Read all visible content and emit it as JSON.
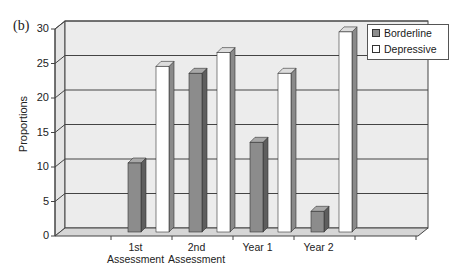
{
  "panel_label": "(b)",
  "chart_data": {
    "type": "bar",
    "title": "",
    "xlabel": "",
    "ylabel": "Proportions",
    "ylim": [
      0,
      30
    ],
    "yticks": [
      0,
      5,
      10,
      15,
      20,
      25,
      30
    ],
    "grid": true,
    "style": "3d-column",
    "legend_position": "top-right",
    "categories": [
      "1st Assessment",
      "2nd Assessment",
      "Year 1",
      "Year 2"
    ],
    "series": [
      {
        "name": "Borderline",
        "values": [
          10,
          23,
          13,
          3
        ],
        "color": "#8c8c8c"
      },
      {
        "name": "Depressive",
        "values": [
          24,
          26,
          23,
          29
        ],
        "color": "#ffffff"
      }
    ]
  },
  "legend": {
    "items": [
      {
        "label": "Borderline",
        "color": "#8c8c8c"
      },
      {
        "label": "Depressive",
        "color": "#ffffff"
      }
    ]
  },
  "axis": {
    "ylabel": "Proportions",
    "yticks": [
      "0",
      "5",
      "10",
      "15",
      "20",
      "25",
      "30"
    ],
    "xticks": [
      {
        "line1": "1st",
        "line2": "Assessment"
      },
      {
        "line1": "2nd",
        "line2": "Assessment"
      },
      {
        "line1": "Year 1",
        "line2": ""
      },
      {
        "line1": "Year 2",
        "line2": ""
      }
    ]
  }
}
